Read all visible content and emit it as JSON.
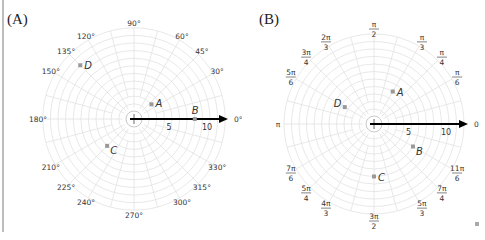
{
  "figure": {
    "panels": [
      {
        "id": "A",
        "label": "(A)",
        "angle_unit": "degrees",
        "angle_labels": [
          "0°",
          "30°",
          "45°",
          "60°",
          "90°",
          "120°",
          "135°",
          "150°",
          "180°",
          "210°",
          "225°",
          "240°",
          "270°",
          "300°",
          "315°",
          "330°"
        ],
        "radial_labels": [
          "5",
          "10"
        ],
        "points": [
          {
            "name": "A",
            "r": 3,
            "theta_deg": 40
          },
          {
            "name": "B",
            "r": 8,
            "theta_deg": 0
          },
          {
            "name": "C",
            "r": 5,
            "theta_deg": 225
          },
          {
            "name": "D",
            "r": 10,
            "theta_deg": 135
          }
        ]
      },
      {
        "id": "B",
        "label": "(B)",
        "angle_unit": "radians",
        "angle_labels": [
          "0",
          "π/6",
          "π/4",
          "π/3",
          "π/2",
          "2π/3",
          "3π/4",
          "5π/6",
          "π",
          "7π/6",
          "5π/4",
          "4π/3",
          "3π/2",
          "5π/3",
          "7π/4",
          "11π/6"
        ],
        "radial_labels": [
          "5",
          "10"
        ],
        "points": [
          {
            "name": "A",
            "r": 5,
            "theta": "π/3"
          },
          {
            "name": "B",
            "r": 6,
            "theta": "11π/6"
          },
          {
            "name": "C",
            "r": 7,
            "theta": "3π/2"
          },
          {
            "name": "D",
            "r": 4.5,
            "theta": "5π/6"
          }
        ]
      }
    ]
  },
  "chart_data": [
    {
      "type": "scatter",
      "title": "(A)",
      "coordinate_system": "polar",
      "angle_unit": "degrees",
      "grid": true,
      "radial_ticks": [
        5,
        10
      ],
      "angle_ticks": [
        0,
        30,
        45,
        60,
        90,
        120,
        135,
        150,
        180,
        210,
        225,
        240,
        270,
        300,
        315,
        330
      ],
      "points": [
        {
          "label": "A",
          "r": 3,
          "theta": 40
        },
        {
          "label": "B",
          "r": 8,
          "theta": 0
        },
        {
          "label": "C",
          "r": 5,
          "theta": 225
        },
        {
          "label": "D",
          "r": 10,
          "theta": 135
        }
      ]
    },
    {
      "type": "scatter",
      "title": "(B)",
      "coordinate_system": "polar",
      "angle_unit": "radians",
      "grid": true,
      "radial_ticks": [
        5,
        10
      ],
      "angle_ticks": [
        "0",
        "π/6",
        "π/4",
        "π/3",
        "π/2",
        "2π/3",
        "3π/4",
        "5π/6",
        "π",
        "7π/6",
        "5π/4",
        "4π/3",
        "3π/2",
        "5π/3",
        "7π/4",
        "11π/6"
      ],
      "points": [
        {
          "label": "A",
          "r": 5,
          "theta": "π/3"
        },
        {
          "label": "B",
          "r": 6,
          "theta": "11π/6"
        },
        {
          "label": "C",
          "r": 7,
          "theta": "3π/2"
        },
        {
          "label": "D",
          "r": 4.5,
          "theta": "5π/6"
        }
      ]
    }
  ]
}
